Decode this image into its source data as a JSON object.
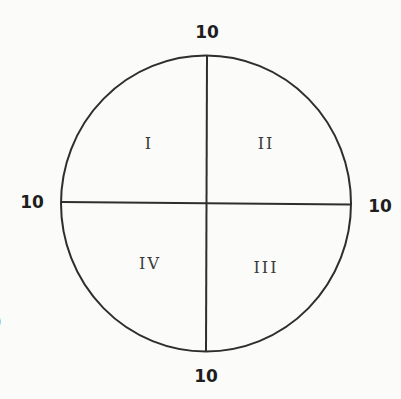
{
  "diagram": {
    "type": "quadrant-circle",
    "colors": {
      "background": "#fbfbfa",
      "stroke": "#2e2e2e",
      "edge_label": "#1e1e1e",
      "quadrant_label": "#3a3a3a"
    },
    "edge_labels": {
      "top": "10",
      "bottom": "10",
      "left": "10",
      "right": "10"
    },
    "quadrants": {
      "top_left": "I",
      "top_right": "II",
      "bottom_right": "III",
      "bottom_left": "IV"
    },
    "cropped_fragment": ")"
  }
}
